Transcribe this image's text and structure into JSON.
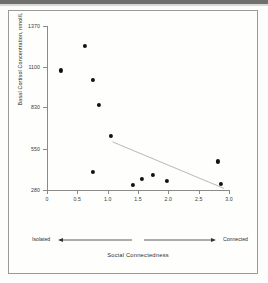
{
  "figure": {
    "background_color": "#fdfdfb",
    "frame_color": "#9a9a96",
    "point_color": "#111111",
    "trendline_color": "#b9b9b5"
  },
  "axis_arrow": {
    "left_label": "Isolated",
    "right_label": "Connected"
  },
  "chart_data": {
    "type": "scatter",
    "title": "",
    "xlabel": "Social Connectedness",
    "ylabel": "Basal Cortisol Concentration, nmol/L",
    "xlim": [
      0,
      3.0
    ],
    "ylim": [
      280,
      1370
    ],
    "grid": false,
    "legend": "none",
    "xticks": [
      0,
      0.5,
      1.0,
      1.5,
      2.0,
      2.5,
      3.0
    ],
    "xtick_labels": [
      "0",
      "0.5",
      "1.0",
      "1.5",
      "2.0",
      "2.5",
      "3.0"
    ],
    "yticks": [
      280,
      550,
      830,
      1100,
      1370
    ],
    "ytick_labels": [
      "280",
      "550",
      "830",
      "1100",
      "1370"
    ],
    "points": [
      {
        "x": 0.23,
        "y": 1075
      },
      {
        "x": 0.62,
        "y": 1240
      },
      {
        "x": 0.75,
        "y": 1010
      },
      {
        "x": 0.85,
        "y": 845
      },
      {
        "x": 1.06,
        "y": 640
      },
      {
        "x": 0.75,
        "y": 400
      },
      {
        "x": 1.42,
        "y": 315
      },
      {
        "x": 1.57,
        "y": 352
      },
      {
        "x": 1.74,
        "y": 382
      },
      {
        "x": 1.98,
        "y": 340
      },
      {
        "x": 2.82,
        "y": 470
      },
      {
        "x": 2.87,
        "y": 318
      }
    ],
    "trendline": {
      "x_start": 1.08,
      "y_start": 600,
      "x_end": 2.92,
      "y_end": 290
    }
  }
}
